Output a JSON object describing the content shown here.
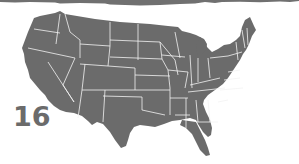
{
  "figure": {
    "label_number": "16",
    "map_region": "Contiguous United States",
    "map_style": "state borders",
    "colors": {
      "land": "#6b6b6b",
      "borders": "#f2f2f2",
      "background": "#ffffff",
      "number": "#6b6b6b",
      "brush_band": "#707070"
    }
  }
}
